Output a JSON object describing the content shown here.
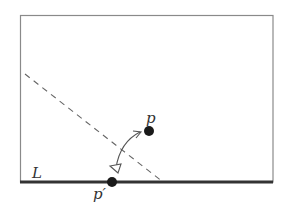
{
  "diagram": {
    "frame": {
      "x": 20,
      "y": 15,
      "width": 253,
      "height": 167,
      "stroke": "#8a8a8a"
    },
    "line_L": {
      "label": "L",
      "x1": 20,
      "y1": 182,
      "x2": 273,
      "y2": 182,
      "stroke": "#333333"
    },
    "dashed_line": {
      "x1": 25,
      "y1": 74,
      "x2": 163,
      "y2": 182,
      "stroke": "#666666"
    },
    "point_p": {
      "label": "p",
      "cx": 149,
      "cy": 131,
      "r": 5
    },
    "point_p_prime": {
      "label": "p′",
      "cx": 112,
      "cy": 182,
      "r": 5
    },
    "arrow": {
      "description": "double-headed curved arrow between p and p-prime",
      "stroke": "#555555"
    }
  }
}
